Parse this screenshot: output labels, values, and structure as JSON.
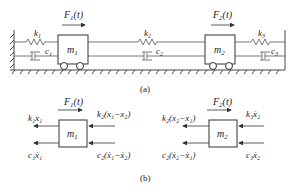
{
  "part_a": {
    "caption": "(a)",
    "mass1": "m",
    "mass1_sub": "1",
    "mass2": "m",
    "mass2_sub": "2",
    "force1": "F",
    "force1_sub": "1",
    "force1_arg": "(t)",
    "force2": "F",
    "force2_sub": "2",
    "force2_arg": "(t)",
    "k1": "k",
    "k1_sub": "1",
    "k2": "k",
    "k2_sub": "2",
    "k3": "k",
    "k3_sub": "3",
    "c1": "c",
    "c1_sub": "1",
    "c2": "c",
    "c2_sub": "2",
    "c3": "c",
    "c3_sub": "3"
  },
  "part_b": {
    "caption": "(b)",
    "fbd1": {
      "mass": "m",
      "mass_sub": "1",
      "force": "F",
      "force_sub": "1",
      "force_arg": "(t)",
      "left_top": "k₁x₁",
      "left_bottom": "c₁ẋ₁",
      "right_top": "k₂(x₁−x₂)",
      "right_bottom": "c₂(ẋ₁−ẋ₂)"
    },
    "fbd2": {
      "mass": "m",
      "mass_sub": "2",
      "force": "F",
      "force_sub": "2",
      "force_arg": "(t)",
      "left_top": "k₂(x₂−x₁)",
      "left_bottom": "c₂(ẋ₂−ẋ₁)",
      "right_top": "k₃ẋ₂",
      "right_bottom": "c₃ẋ₂"
    }
  }
}
